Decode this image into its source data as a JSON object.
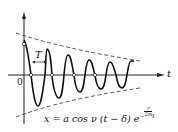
{
  "diagram": {
    "axes": {
      "x_label": "t",
      "origin_label": "0"
    },
    "period_label": "T",
    "equation": {
      "lhs": "x = a cos ν (t − δ) e",
      "exp_prefix": "−",
      "exp_num": "r",
      "exp_den": "2m",
      "exp_suffix": "t",
      "full": "x = a cos ν(t − δ) e^(−(r/2m) t)"
    },
    "colors": {
      "curve": "#111111",
      "envelope": "#333333",
      "axis": "#222222"
    }
  }
}
